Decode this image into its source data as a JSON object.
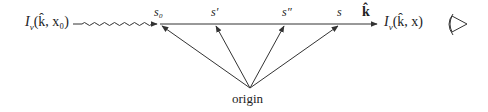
{
  "diagram": {
    "source_label": "Iν(k̂, x₀)",
    "source_label_parts": {
      "I": "I",
      "sub": "ν",
      "args": "(k̂, x₀)"
    },
    "observed_label_parts": {
      "I": "I",
      "sub": "ν",
      "args": "(k̂, x)"
    },
    "points": [
      {
        "id": "s0",
        "label": "s₀",
        "x": 160
      },
      {
        "id": "s_prime",
        "label": "s′",
        "x": 215
      },
      {
        "id": "s_double_prime",
        "label": "s″",
        "x": 287
      },
      {
        "id": "s",
        "label": "s",
        "x": 340
      }
    ],
    "direction_label": "k̂",
    "origin_label": "origin",
    "observer_icon": "eye-icon",
    "stroke_color": "#333333"
  }
}
